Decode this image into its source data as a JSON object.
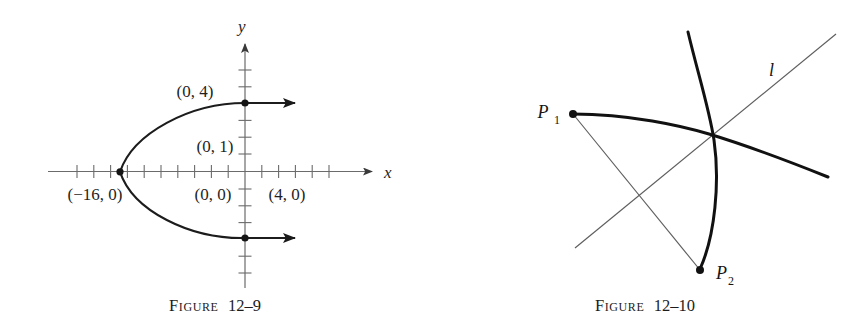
{
  "page": {
    "background_color": "#ffffff",
    "ink_color": "#1a1a1a",
    "width": 860,
    "height": 329
  },
  "figures": [
    {
      "id": "figure-12-9",
      "caption_prefix": "Figure",
      "caption_number": "12–9",
      "caption": "Figure 12–9",
      "description": "Sideways parabola opening to the right with vertex on the negative x-axis",
      "axes": {
        "x_label": "x",
        "y_label": "y",
        "tick_count_x": 16,
        "tick_count_y": 8,
        "axis_color": "#6b6b6b",
        "unit_px": 16.8
      },
      "point_labels": [
        {
          "name": "label-0-4",
          "text": "(0, 4)",
          "x": 232,
          "y": 97
        },
        {
          "name": "label-0-1",
          "text": "(0, 1)",
          "x": 232,
          "y": 152
        },
        {
          "name": "label-0-0",
          "text": "(0, 0)",
          "x": 232,
          "y": 207
        },
        {
          "name": "label-4-0",
          "text": "(4, 0)",
          "x": 303,
          "y": 207
        },
        {
          "name": "label-neg16",
          "text": "(−16, 0)",
          "x": 110,
          "y": 207
        }
      ],
      "marked_points": [
        {
          "name": "vertex-point",
          "label": "(−16, 0)"
        },
        {
          "name": "upper-curve-point",
          "label": "(0, 4)"
        },
        {
          "name": "lower-curve-point",
          "label": "(0, −4)"
        }
      ]
    },
    {
      "id": "figure-12-10",
      "caption_prefix": "Figure",
      "caption_number": "12–10",
      "caption": "Figure 12–10",
      "description": "Two heavy curved arcs crossing, a thin straight line l, and a thin chord joining points P1 and P2",
      "line_label": {
        "name": "line-l-label",
        "text": "l",
        "x": 775,
        "y": 70
      },
      "points": [
        {
          "name": "point-p1",
          "base": "P",
          "subscript": "1",
          "label": "P₁",
          "x": 573,
          "y": 114
        },
        {
          "name": "point-p2",
          "base": "P",
          "subscript": "2",
          "label": "P₂",
          "x": 700,
          "y": 270
        }
      ],
      "curve_color": "#111111",
      "line_color": "#5a5a5a"
    }
  ]
}
